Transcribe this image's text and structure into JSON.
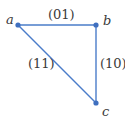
{
  "diagram": {
    "type": "graph",
    "colors": {
      "edge": "#4a7cc9",
      "vertex": "#3f6fbf",
      "text": "#3a3a3a"
    },
    "vertices": [
      {
        "id": "a",
        "label": "a",
        "x": 18,
        "y": 25
      },
      {
        "id": "b",
        "label": "b",
        "x": 96,
        "y": 25
      },
      {
        "id": "c",
        "label": "c",
        "x": 96,
        "y": 103
      }
    ],
    "edges": [
      {
        "from": "a",
        "to": "b",
        "label": "(01)"
      },
      {
        "from": "b",
        "to": "c",
        "label": "(10)"
      },
      {
        "from": "a",
        "to": "c",
        "label": "(11)"
      }
    ]
  }
}
